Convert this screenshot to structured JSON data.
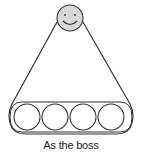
{
  "diagram": {
    "caption": "As the boss",
    "leader": {
      "label": "smiling-face",
      "fill": "#d8d8d8"
    },
    "members": [
      {
        "cx": 27
      },
      {
        "cx": 55
      },
      {
        "cx": 83
      },
      {
        "cx": 111
      }
    ],
    "stroke_color": "#333333"
  }
}
